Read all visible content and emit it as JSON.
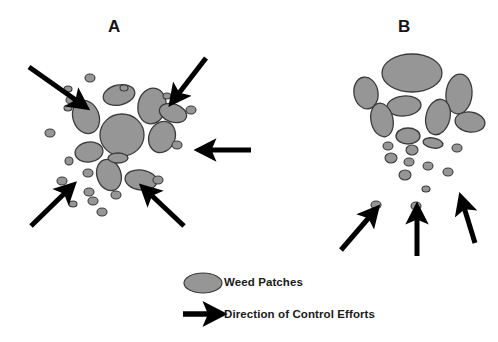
{
  "figure": {
    "width": 498,
    "height": 342,
    "background_color": "#ffffff"
  },
  "panels": [
    {
      "id": "A",
      "label": "A",
      "label_x": 108,
      "label_y": 17
    },
    {
      "id": "B",
      "label": "B",
      "label_x": 398,
      "label_y": 17
    }
  ],
  "legend": {
    "weed_label": "Weed Patches",
    "arrow_label": "Direction of Control Efforts",
    "patch_swatch_name": "weed-patch-ellipse",
    "arrow_swatch_name": "control-effort-arrow"
  },
  "colors": {
    "patch_fill": "#969696",
    "patch_stroke": "#3b3b3b",
    "arrow_fill": "#000000",
    "text": "#151515",
    "background": "#ffffff"
  },
  "chart_data": {
    "type": "diagram",
    "title": "",
    "panel_a": {
      "label": "A",
      "pattern": "radially dispersed cluster with large central patches surrounded by small satellite patches; control efforts directed inward from all sides",
      "patches": [
        {
          "cx": 122,
          "cy": 135,
          "rx": 22,
          "ry": 21,
          "rot": 0
        },
        {
          "cx": 86,
          "cy": 117,
          "rx": 13,
          "ry": 17,
          "rot": -20
        },
        {
          "cx": 119,
          "cy": 95,
          "rx": 16,
          "ry": 10,
          "rot": -12
        },
        {
          "cx": 152,
          "cy": 106,
          "rx": 14,
          "ry": 18,
          "rot": 10
        },
        {
          "cx": 162,
          "cy": 137,
          "rx": 13,
          "ry": 16,
          "rot": 22
        },
        {
          "cx": 173,
          "cy": 113,
          "rx": 14,
          "ry": 9,
          "rot": 18
        },
        {
          "cx": 89,
          "cy": 152,
          "rx": 14,
          "ry": 10,
          "rot": -8
        },
        {
          "cx": 109,
          "cy": 175,
          "rx": 12,
          "ry": 16,
          "rot": -18
        },
        {
          "cx": 141,
          "cy": 180,
          "rx": 16,
          "ry": 10,
          "rot": 8
        },
        {
          "cx": 118,
          "cy": 158,
          "rx": 10,
          "ry": 5,
          "rot": 0
        },
        {
          "cx": 71,
          "cy": 100,
          "rx": 5,
          "ry": 4,
          "rot": 0
        },
        {
          "cx": 50,
          "cy": 133,
          "rx": 5,
          "ry": 4,
          "rot": 0
        },
        {
          "cx": 68,
          "cy": 89,
          "rx": 4,
          "ry": 3,
          "rot": 0
        },
        {
          "cx": 90,
          "cy": 78,
          "rx": 5,
          "ry": 4,
          "rot": 0
        },
        {
          "cx": 124,
          "cy": 88,
          "rx": 4,
          "ry": 3,
          "rot": 0
        },
        {
          "cx": 68,
          "cy": 108,
          "rx": 4,
          "ry": 3,
          "rot": 0
        },
        {
          "cx": 167,
          "cy": 96,
          "rx": 4,
          "ry": 3,
          "rot": 0
        },
        {
          "cx": 191,
          "cy": 110,
          "rx": 5,
          "ry": 4,
          "rot": 0
        },
        {
          "cx": 177,
          "cy": 145,
          "rx": 5,
          "ry": 4,
          "rot": 0
        },
        {
          "cx": 69,
          "cy": 161,
          "rx": 4,
          "ry": 4,
          "rot": 0
        },
        {
          "cx": 62,
          "cy": 181,
          "rx": 5,
          "ry": 4,
          "rot": 0
        },
        {
          "cx": 88,
          "cy": 173,
          "rx": 5,
          "ry": 4,
          "rot": 0
        },
        {
          "cx": 89,
          "cy": 192,
          "rx": 5,
          "ry": 4,
          "rot": 0
        },
        {
          "cx": 93,
          "cy": 201,
          "rx": 5,
          "ry": 4,
          "rot": 0
        },
        {
          "cx": 116,
          "cy": 195,
          "rx": 5,
          "ry": 4,
          "rot": 0
        },
        {
          "cx": 158,
          "cy": 180,
          "rx": 5,
          "ry": 4,
          "rot": 0
        },
        {
          "cx": 102,
          "cy": 212,
          "rx": 5,
          "ry": 4,
          "rot": 0
        },
        {
          "cx": 73,
          "cy": 204,
          "rx": 4,
          "ry": 3,
          "rot": 0
        }
      ],
      "arrows": [
        {
          "name": "arrow-top-left",
          "x1": 29,
          "y1": 67,
          "x2": 80,
          "y2": 103
        },
        {
          "name": "arrow-top-right",
          "x1": 206,
          "y1": 58,
          "x2": 176,
          "y2": 97
        },
        {
          "name": "arrow-right",
          "x1": 251,
          "y1": 150,
          "x2": 206,
          "y2": 150
        },
        {
          "name": "arrow-bottom-left",
          "x1": 31,
          "y1": 226,
          "x2": 68,
          "y2": 190
        },
        {
          "name": "arrow-bottom-right",
          "x1": 184,
          "y1": 226,
          "x2": 148,
          "y2": 192
        }
      ]
    },
    "panel_b": {
      "label": "B",
      "pattern": "dense patch aggregation at top tapering to a narrowing tail of small patches below; control efforts directed upward along the tail",
      "patches": [
        {
          "cx": 412,
          "cy": 73,
          "rx": 30,
          "ry": 19,
          "rot": 0
        },
        {
          "cx": 366,
          "cy": 93,
          "rx": 12,
          "ry": 16,
          "rot": -10
        },
        {
          "cx": 459,
          "cy": 94,
          "rx": 13,
          "ry": 20,
          "rot": 5
        },
        {
          "cx": 404,
          "cy": 106,
          "rx": 17,
          "ry": 10,
          "rot": -5
        },
        {
          "cx": 438,
          "cy": 117,
          "rx": 12,
          "ry": 18,
          "rot": 14
        },
        {
          "cx": 382,
          "cy": 120,
          "rx": 11,
          "ry": 17,
          "rot": -12
        },
        {
          "cx": 470,
          "cy": 122,
          "rx": 15,
          "ry": 10,
          "rot": 8
        },
        {
          "cx": 408,
          "cy": 136,
          "rx": 12,
          "ry": 8,
          "rot": 0
        },
        {
          "cx": 433,
          "cy": 143,
          "rx": 10,
          "ry": 5,
          "rot": 10
        },
        {
          "cx": 388,
          "cy": 146,
          "rx": 5,
          "ry": 4,
          "rot": 0
        },
        {
          "cx": 412,
          "cy": 150,
          "rx": 6,
          "ry": 5,
          "rot": 0
        },
        {
          "cx": 457,
          "cy": 148,
          "rx": 5,
          "ry": 4,
          "rot": 0
        },
        {
          "cx": 391,
          "cy": 158,
          "rx": 6,
          "ry": 5,
          "rot": 0
        },
        {
          "cx": 409,
          "cy": 162,
          "rx": 5,
          "ry": 4,
          "rot": 0
        },
        {
          "cx": 428,
          "cy": 166,
          "rx": 5,
          "ry": 4,
          "rot": 0
        },
        {
          "cx": 448,
          "cy": 172,
          "rx": 5,
          "ry": 4,
          "rot": 0
        },
        {
          "cx": 405,
          "cy": 175,
          "rx": 6,
          "ry": 5,
          "rot": 0
        },
        {
          "cx": 426,
          "cy": 189,
          "rx": 4,
          "ry": 3,
          "rot": 0
        },
        {
          "cx": 376,
          "cy": 205,
          "rx": 5,
          "ry": 4,
          "rot": 0
        },
        {
          "cx": 416,
          "cy": 206,
          "rx": 5,
          "ry": 4,
          "rot": 0
        }
      ],
      "arrows": [
        {
          "name": "arrow-bottom-left",
          "x1": 341,
          "y1": 250,
          "x2": 372,
          "y2": 214
        },
        {
          "name": "arrow-bottom-center",
          "x1": 417,
          "y1": 256,
          "x2": 417,
          "y2": 214
        },
        {
          "name": "arrow-bottom-right",
          "x1": 475,
          "y1": 243,
          "x2": 463,
          "y2": 204
        }
      ]
    }
  }
}
